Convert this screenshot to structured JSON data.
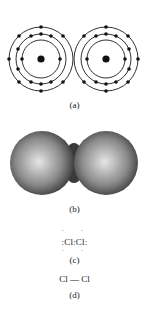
{
  "figure": {
    "panels": [
      {
        "id": "a",
        "label": "(a)",
        "description": "Bohr model electron shells of two chlorine atoms",
        "shells_per_atom": 3,
        "electrons_per_shell": [
          2,
          8,
          7
        ]
      },
      {
        "id": "b",
        "label": "(b)",
        "description": "Space-filling model of Cl2"
      },
      {
        "id": "c",
        "label": "(c)",
        "description": "Lewis dot structure",
        "formula": ":Cl:Cl:",
        "atom_left": "Cl",
        "atom_right": "Cl"
      },
      {
        "id": "d",
        "label": "(d)",
        "description": "Structural formula",
        "atom_left": "Cl",
        "bond": "—",
        "atom_right": "Cl"
      }
    ]
  },
  "colors": {
    "line": "#1a1a1a",
    "sphere_light": "#e6e6e6",
    "sphere_dark": "#2e2e2e"
  }
}
